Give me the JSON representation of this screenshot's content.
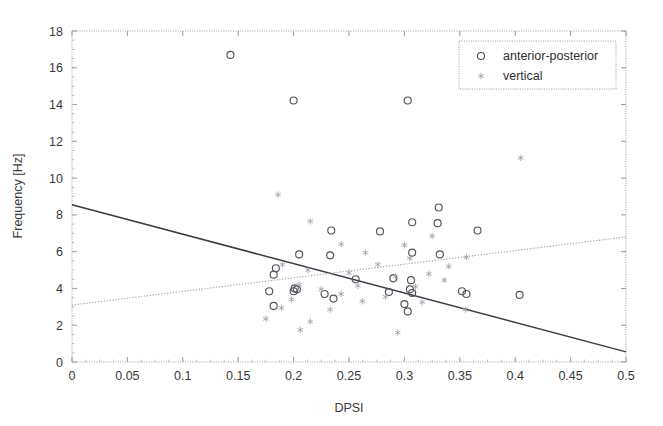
{
  "chart_data": {
    "type": "scatter",
    "title": "",
    "xlabel": "DPSI",
    "ylabel": "Frequency [Hz]",
    "xlim": [
      0,
      0.5
    ],
    "ylim": [
      0,
      18
    ],
    "xticks": [
      "0",
      "0.05",
      "0.1",
      "0.15",
      "0.2",
      "0.25",
      "0.3",
      "0.35",
      "0.4",
      "0.45",
      "0.5"
    ],
    "xtick_values": [
      0,
      0.05,
      0.1,
      0.15,
      0.2,
      0.25,
      0.3,
      0.35,
      0.4,
      0.45,
      0.5
    ],
    "yticks": [
      "0",
      "2",
      "4",
      "6",
      "8",
      "10",
      "12",
      "14",
      "16",
      "18"
    ],
    "ytick_values": [
      0,
      2,
      4,
      6,
      8,
      10,
      12,
      14,
      16,
      18
    ],
    "grid": false,
    "legend_position": "upper-right",
    "series": [
      {
        "name": "anterior-posterior",
        "marker": "circle",
        "color": "#53535c",
        "points": [
          [
            0.143,
            16.7
          ],
          [
            0.2,
            14.22
          ],
          [
            0.303,
            14.22
          ],
          [
            0.331,
            8.4
          ],
          [
            0.33,
            7.55
          ],
          [
            0.307,
            7.6
          ],
          [
            0.234,
            7.15
          ],
          [
            0.278,
            7.1
          ],
          [
            0.366,
            7.15
          ],
          [
            0.205,
            5.85
          ],
          [
            0.233,
            5.8
          ],
          [
            0.307,
            5.95
          ],
          [
            0.332,
            5.85
          ],
          [
            0.184,
            5.1
          ],
          [
            0.182,
            4.75
          ],
          [
            0.256,
            4.5
          ],
          [
            0.29,
            4.55
          ],
          [
            0.306,
            4.45
          ],
          [
            0.201,
            4.0
          ],
          [
            0.203,
            3.95
          ],
          [
            0.2,
            3.85
          ],
          [
            0.178,
            3.85
          ],
          [
            0.228,
            3.7
          ],
          [
            0.286,
            3.8
          ],
          [
            0.305,
            3.95
          ],
          [
            0.307,
            3.75
          ],
          [
            0.352,
            3.85
          ],
          [
            0.356,
            3.7
          ],
          [
            0.404,
            3.65
          ],
          [
            0.182,
            3.05
          ],
          [
            0.3,
            3.15
          ],
          [
            0.303,
            2.75
          ],
          [
            0.236,
            3.45
          ]
        ]
      },
      {
        "name": "vertical",
        "marker": "star",
        "color": "#9d9da6",
        "points": [
          [
            0.405,
            11.1
          ],
          [
            0.186,
            9.1
          ],
          [
            0.215,
            7.65
          ],
          [
            0.325,
            6.85
          ],
          [
            0.243,
            6.4
          ],
          [
            0.3,
            6.35
          ],
          [
            0.265,
            5.95
          ],
          [
            0.356,
            5.7
          ],
          [
            0.305,
            5.65
          ],
          [
            0.34,
            5.2
          ],
          [
            0.276,
            5.3
          ],
          [
            0.19,
            5.3
          ],
          [
            0.213,
            5.0
          ],
          [
            0.25,
            4.85
          ],
          [
            0.322,
            4.8
          ],
          [
            0.292,
            4.65
          ],
          [
            0.336,
            4.45
          ],
          [
            0.205,
            4.2
          ],
          [
            0.258,
            4.15
          ],
          [
            0.31,
            4.1
          ],
          [
            0.225,
            3.95
          ],
          [
            0.243,
            3.7
          ],
          [
            0.283,
            3.55
          ],
          [
            0.198,
            3.4
          ],
          [
            0.262,
            3.3
          ],
          [
            0.316,
            3.25
          ],
          [
            0.189,
            2.95
          ],
          [
            0.233,
            2.85
          ],
          [
            0.355,
            2.85
          ],
          [
            0.175,
            2.35
          ],
          [
            0.206,
            1.75
          ],
          [
            0.294,
            1.6
          ],
          [
            0.215,
            2.2
          ]
        ]
      }
    ],
    "trendlines": [
      {
        "name": "anterior-posterior-fit",
        "style": "solid",
        "color": "#3b3b44",
        "x": [
          0,
          0.5
        ],
        "y": [
          8.55,
          0.55
        ]
      },
      {
        "name": "vertical-fit",
        "style": "dotted",
        "color": "#a9a9b2",
        "x": [
          0,
          0.5
        ],
        "y": [
          3.1,
          6.8
        ]
      }
    ]
  },
  "legend": {
    "entries": [
      {
        "label": "anterior-posterior",
        "marker": "circle"
      },
      {
        "label": "vertical",
        "marker": "star"
      }
    ]
  },
  "axes": {
    "x_title": "DPSI",
    "y_title": "Frequency [Hz]"
  }
}
